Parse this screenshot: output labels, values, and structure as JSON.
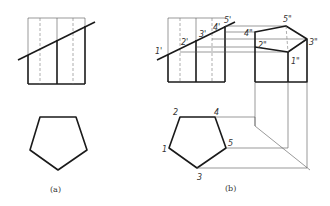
{
  "figure": {
    "panel_a": {
      "caption": "(a)"
    },
    "panel_b": {
      "caption": "(b)",
      "front_view_labels": [
        "1'",
        "2'",
        "3'",
        "4'",
        "5'"
      ],
      "side_view_labels": [
        "1\"",
        "2\"",
        "3\"",
        "4\"",
        "5\""
      ],
      "top_view_labels": [
        "1",
        "2",
        "3",
        "4",
        "5"
      ]
    }
  }
}
